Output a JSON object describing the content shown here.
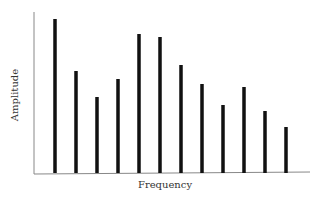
{
  "chart_data": {
    "type": "bar",
    "title": "",
    "xlabel": "Frequency",
    "ylabel": "Amplitude",
    "categories": [
      "1",
      "2",
      "3",
      "4",
      "5",
      "6",
      "7",
      "8",
      "9",
      "10",
      "11",
      "12"
    ],
    "values": [
      154,
      102,
      76,
      94,
      139,
      136,
      108,
      89,
      68,
      86,
      62,
      46
    ],
    "ylim": [
      0,
      160
    ],
    "grid": false,
    "legend": null,
    "bar_color": "#111111",
    "axis_color": "#888888",
    "layout": {
      "origin_x": 34,
      "baseline_y": 173,
      "first_bar_x": 55,
      "bar_spacing": 21,
      "bar_width": 3.5,
      "axis_top_y": 12,
      "axis_right_x": 310
    }
  }
}
